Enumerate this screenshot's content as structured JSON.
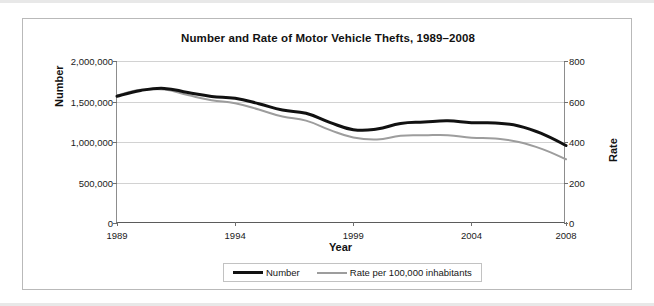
{
  "chart_data": {
    "type": "line",
    "title": "Number and Rate of Motor Vehicle Thefts, 1989–2008",
    "xlabel": "Year",
    "ylabel": "Number",
    "ylabel_right": "Rate",
    "grid": true,
    "legend_position": "bottom",
    "x": [
      1989,
      1990,
      1991,
      1992,
      1993,
      1994,
      1995,
      1996,
      1997,
      1998,
      1999,
      2000,
      2001,
      2002,
      2003,
      2004,
      2005,
      2006,
      2007,
      2008
    ],
    "xtick_labels": [
      "1989",
      "1994",
      "1999",
      "2004",
      "2008"
    ],
    "xtick_values": [
      1989,
      1994,
      1999,
      2004,
      2008
    ],
    "ylim": [
      0,
      2000000
    ],
    "ytick_labels": [
      "0",
      "500,000",
      "1,000,000",
      "1,500,000",
      "2,000,000"
    ],
    "ytick_values": [
      0,
      500000,
      1000000,
      1500000,
      2000000
    ],
    "ylim_right": [
      0,
      800
    ],
    "ytick_labels_right": [
      "0",
      "200",
      "400",
      "600",
      "800"
    ],
    "ytick_values_right": [
      0,
      200,
      400,
      600,
      800
    ],
    "series": [
      {
        "name": "Number",
        "axis": "left",
        "color": "#111111",
        "width": 3,
        "values": [
          1564800,
          1635900,
          1661700,
          1610800,
          1563100,
          1539300,
          1472400,
          1394200,
          1354200,
          1242800,
          1152100,
          1160000,
          1228400,
          1246600,
          1261200,
          1237900,
          1235900,
          1198200,
          1100500,
          956800
        ]
      },
      {
        "name": "Rate per 100,000 inhabitants",
        "axis": "right",
        "color": "#9d9d9d",
        "width": 2,
        "values": [
          630.4,
          657.8,
          659.0,
          631.6,
          606.3,
          591.3,
          560.3,
          525.7,
          505.7,
          459.9,
          422.5,
          412.2,
          430.5,
          432.9,
          433.7,
          421.5,
          416.8,
          400.2,
          364.9,
          314.7
        ]
      }
    ]
  },
  "legend": {
    "items": [
      {
        "label": "Number",
        "marker": "black-line"
      },
      {
        "label": "Rate per 100,000 inhabitants",
        "marker": "gray-line"
      }
    ]
  },
  "colors": {
    "number_series": "#111111",
    "rate_series": "#9d9d9d",
    "gridline": "#d2d2d2",
    "axis": "#5b5b5b",
    "frame_border": "#b9b9b9"
  }
}
